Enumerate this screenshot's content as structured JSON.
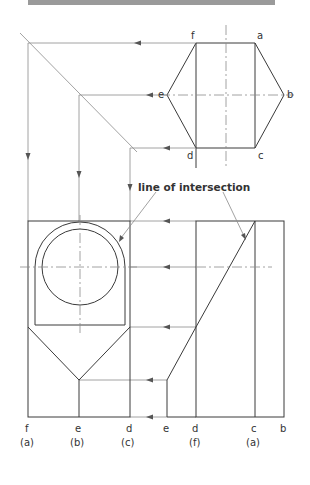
{
  "diagram": {
    "type": "orthographic-projection-intersection",
    "annotation": "line of intersection",
    "plan_view": {
      "shape": "hexagon",
      "vertex_labels": [
        "a",
        "b",
        "c",
        "d",
        "e",
        "f"
      ]
    },
    "front_view": {
      "bottom_labels": [
        {
          "top": "f",
          "bottom": "(a)"
        },
        {
          "top": "e",
          "bottom": "(b)"
        },
        {
          "top": "d",
          "bottom": "(c)"
        }
      ]
    },
    "side_view": {
      "bottom_labels": [
        {
          "top": "e",
          "bottom": ""
        },
        {
          "top": "d",
          "bottom": "(f)"
        },
        {
          "top": "c",
          "bottom": "(a)"
        },
        {
          "top": "b",
          "bottom": ""
        }
      ]
    }
  },
  "labels": {
    "hex_f": "f",
    "hex_a": "a",
    "hex_e": "e",
    "hex_b": "b",
    "hex_d": "d",
    "hex_c": "c",
    "fv_f": "f",
    "fv_f2": "(a)",
    "fv_e": "e",
    "fv_e2": "(b)",
    "fv_d": "d",
    "fv_d2": "(c)",
    "sv_e": "e",
    "sv_d": "d",
    "sv_d2": "(f)",
    "sv_c": "c",
    "sv_c2": "(a)",
    "sv_b": "b",
    "note": "line of intersection"
  }
}
